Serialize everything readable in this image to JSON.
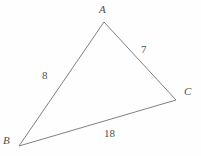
{
  "figure": {
    "kind": "triangle-diagram",
    "canvas": {
      "width": 201,
      "height": 156
    },
    "background_color": "#fefefe",
    "stroke_color": "#808080",
    "stroke_width": 1,
    "text_color": "#4f4f4f"
  },
  "vertices": [
    {
      "name": "A",
      "label": "A",
      "x": 104,
      "y": 22,
      "label_x": 99,
      "label_y": 4
    },
    {
      "name": "B",
      "label": "B",
      "x": 19,
      "y": 146,
      "label_x": 3,
      "label_y": 135
    },
    {
      "name": "C",
      "label": "C",
      "x": 176,
      "y": 100,
      "label_x": 184,
      "label_y": 86
    }
  ],
  "sides": [
    {
      "name": "AB",
      "from": "A",
      "to": "B",
      "length_label": "8",
      "label_x": 42,
      "label_y": 70
    },
    {
      "name": "AC",
      "from": "A",
      "to": "C",
      "length_label": "7",
      "label_x": 141,
      "label_y": 44
    },
    {
      "name": "BC",
      "from": "B",
      "to": "C",
      "length_label": "18",
      "label_x": 104,
      "label_y": 128
    }
  ],
  "chart_data": {
    "type": "diagram",
    "title": "",
    "shape": "triangle",
    "vertex_labels": [
      "A",
      "B",
      "C"
    ],
    "side_labels": [
      "8",
      "7",
      "18"
    ],
    "side_label_map": {
      "AB": "8",
      "AC": "7",
      "BC": "18"
    },
    "points": {
      "A": [
        104,
        22
      ],
      "B": [
        19,
        146
      ],
      "C": [
        176,
        100
      ]
    },
    "annotations": [
      "A",
      "B",
      "C",
      "8",
      "7",
      "18"
    ]
  }
}
